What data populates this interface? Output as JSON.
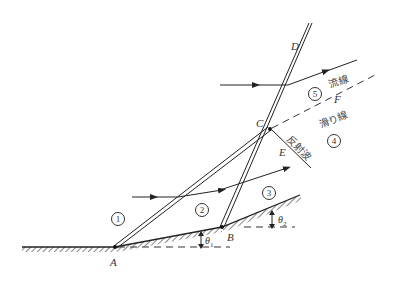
{
  "diagram": {
    "points": {
      "A": {
        "label": "A",
        "x": 115,
        "y": 247
      },
      "B": {
        "label": "B",
        "x": 222,
        "y": 227
      },
      "C": {
        "label": "C",
        "x": 270,
        "y": 129
      },
      "D": {
        "label": "D",
        "x": 311,
        "y": 23
      },
      "E": {
        "label": "E"
      },
      "F": {
        "label": "F"
      }
    },
    "regions": [
      "1",
      "2",
      "3",
      "4",
      "5"
    ],
    "angles": {
      "theta1": {
        "symbol": "θ",
        "sub": "1"
      },
      "theta2": {
        "symbol": "θ",
        "sub": "2"
      }
    },
    "annotations": {
      "streamline": "流線",
      "slip_line": "滑り線",
      "reflected_wave": "反射波"
    },
    "colors": {
      "line": "#222222",
      "hatch": "#333333",
      "background": "#ffffff"
    }
  }
}
